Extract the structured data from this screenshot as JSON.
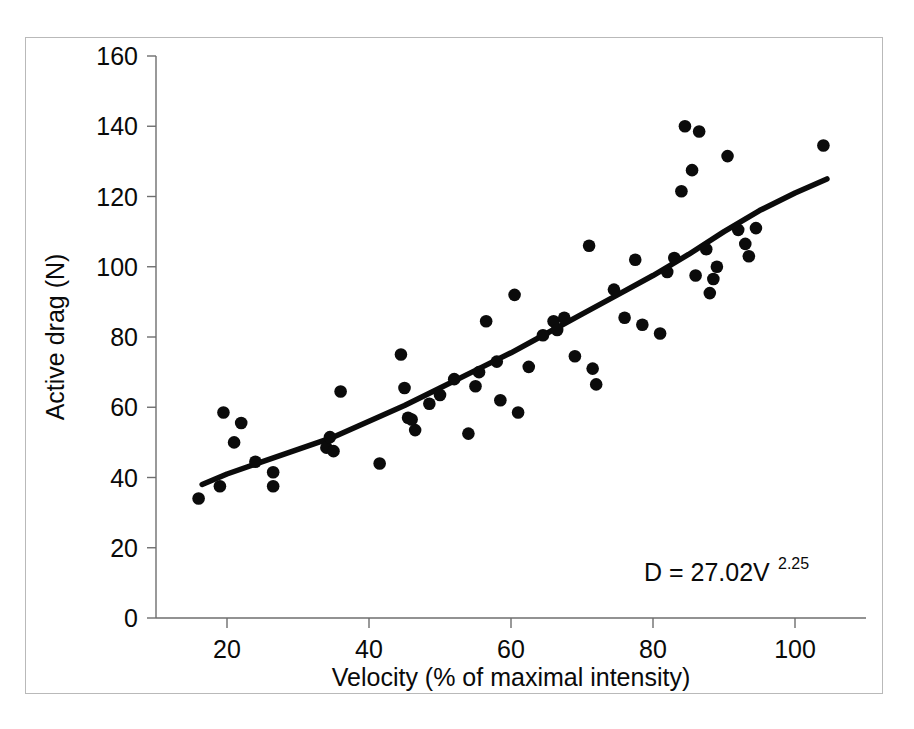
{
  "chart_data": {
    "type": "scatter",
    "title": "",
    "xlabel": "Velocity (% of maximal intensity)",
    "ylabel": "Active drag (N)",
    "xlim": [
      10,
      110
    ],
    "ylim": [
      0,
      160
    ],
    "xticks": [
      20,
      40,
      60,
      80,
      100
    ],
    "yticks": [
      0,
      20,
      40,
      60,
      80,
      100,
      120,
      140,
      160
    ],
    "grid": false,
    "legend": null,
    "annotations": [
      {
        "name": "regression-equation",
        "text_base": "D = 27.02V",
        "text_superscript": "2.25",
        "full_text": "D = 27.02V^2.25",
        "x": 80,
        "y": 27
      }
    ],
    "series": [
      {
        "name": "Active drag measurements",
        "type": "scatter",
        "marker": "filled-circle",
        "color": "#0b0b0b",
        "points": [
          [
            16.0,
            34.0
          ],
          [
            19.0,
            37.5
          ],
          [
            19.5,
            58.5
          ],
          [
            21.0,
            50.0
          ],
          [
            22.0,
            55.5
          ],
          [
            24.0,
            44.5
          ],
          [
            26.5,
            41.5
          ],
          [
            26.5,
            37.5
          ],
          [
            34.0,
            48.5
          ],
          [
            34.5,
            51.5
          ],
          [
            35.0,
            47.5
          ],
          [
            36.0,
            64.5
          ],
          [
            41.5,
            44.0
          ],
          [
            44.5,
            75.0
          ],
          [
            45.0,
            65.5
          ],
          [
            45.5,
            57.0
          ],
          [
            46.5,
            53.5
          ],
          [
            46.0,
            56.5
          ],
          [
            48.5,
            61.0
          ],
          [
            50.0,
            63.5
          ],
          [
            52.0,
            68.0
          ],
          [
            54.0,
            52.5
          ],
          [
            55.0,
            66.0
          ],
          [
            55.5,
            70.0
          ],
          [
            56.5,
            84.5
          ],
          [
            58.0,
            73.0
          ],
          [
            58.5,
            62.0
          ],
          [
            60.5,
            92.0
          ],
          [
            61.0,
            58.5
          ],
          [
            62.5,
            71.5
          ],
          [
            64.5,
            80.5
          ],
          [
            66.0,
            84.5
          ],
          [
            66.5,
            82.0
          ],
          [
            67.5,
            85.5
          ],
          [
            69.0,
            74.5
          ],
          [
            71.0,
            106.0
          ],
          [
            71.5,
            71.0
          ],
          [
            72.0,
            66.5
          ],
          [
            74.5,
            93.5
          ],
          [
            76.0,
            85.5
          ],
          [
            77.5,
            102.0
          ],
          [
            78.5,
            83.5
          ],
          [
            81.0,
            81.0
          ],
          [
            82.0,
            98.5
          ],
          [
            83.0,
            102.5
          ],
          [
            84.0,
            121.5
          ],
          [
            84.5,
            140.0
          ],
          [
            85.5,
            127.5
          ],
          [
            86.0,
            97.5
          ],
          [
            86.5,
            138.5
          ],
          [
            87.5,
            105.0
          ],
          [
            88.0,
            92.5
          ],
          [
            88.5,
            96.5
          ],
          [
            89.0,
            100.0
          ],
          [
            90.5,
            131.5
          ],
          [
            92.0,
            110.5
          ],
          [
            93.0,
            106.5
          ],
          [
            93.5,
            103.0
          ],
          [
            94.5,
            111.0
          ],
          [
            104.0,
            134.5
          ]
        ]
      },
      {
        "name": "Fitted power curve",
        "type": "line",
        "color": "#0b0b0b",
        "equation": "D = 27.02V^2.25",
        "points": [
          [
            16.5,
            38.0
          ],
          [
            20.0,
            41.0
          ],
          [
            25.0,
            44.5
          ],
          [
            30.0,
            48.0
          ],
          [
            35.0,
            51.5
          ],
          [
            40.0,
            56.0
          ],
          [
            45.0,
            60.5
          ],
          [
            50.0,
            65.5
          ],
          [
            55.0,
            70.5
          ],
          [
            60.0,
            75.5
          ],
          [
            65.0,
            81.0
          ],
          [
            70.0,
            86.5
          ],
          [
            75.0,
            92.0
          ],
          [
            80.0,
            97.5
          ],
          [
            85.0,
            103.5
          ],
          [
            90.0,
            110.0
          ],
          [
            95.0,
            116.0
          ],
          [
            100.0,
            121.0
          ],
          [
            104.5,
            125.0
          ]
        ]
      }
    ]
  },
  "figure": {
    "background_color": "#ffffff",
    "axis_color": "#6e6e6e",
    "marker_color": "#0b0b0b",
    "text_color": "#0a0a0a"
  }
}
